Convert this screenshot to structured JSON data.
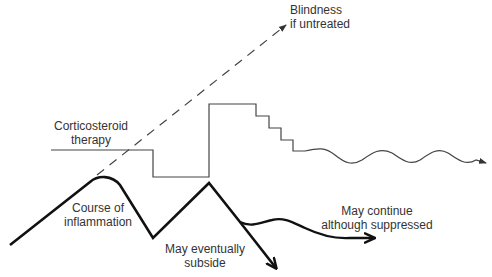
{
  "labels": {
    "blindness": {
      "line1": "Blindness",
      "line2": "if untreated"
    },
    "corticosteroid": {
      "line1": "Corticosteroid",
      "line2": "therapy"
    },
    "course": {
      "line1": "Course of",
      "line2": "inflammation"
    },
    "subside": {
      "line1": "May eventually",
      "line2": "subside"
    },
    "continue": {
      "line1": "May continue",
      "line2": "although suppressed"
    }
  },
  "colors": {
    "thin_line": "#444444",
    "thick_line": "#111111",
    "text": "#333333",
    "background": "#ffffff"
  }
}
